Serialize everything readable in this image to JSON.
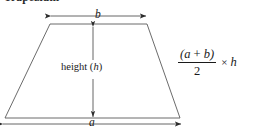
{
  "page": {
    "width": 265,
    "height": 137,
    "background": "#ffffff",
    "ink": "#1a1a1a"
  },
  "heading": {
    "text": "Trapezium",
    "note": "clipped at top edge of image"
  },
  "diagram": {
    "shape_name": "trapezoid",
    "stroke_color": "#555555",
    "fill": "none",
    "vertices": {
      "top_left": [
        50,
        24
      ],
      "top_right": [
        147,
        24
      ],
      "bottom_right": [
        180,
        118
      ],
      "bottom_left": [
        5,
        118
      ]
    }
  },
  "labels": {
    "top_base": "b",
    "bottom_base": "a",
    "height_text": "height (",
    "height_var": "h",
    "height_close": ")"
  },
  "dimensions": {
    "top_arrow": {
      "y": 16,
      "x1": 50,
      "x2": 147,
      "label": "b"
    },
    "bottom_arrow": {
      "y": 124,
      "x1": 2,
      "x2": 182,
      "label": "a"
    },
    "height_arrow": {
      "x": 93,
      "y1": 26,
      "y2": 118,
      "label": "height (h)"
    }
  },
  "formula": {
    "numerator_open": "(",
    "numerator_a": "a",
    "numerator_op": " + ",
    "numerator_b": "b",
    "numerator_close": ")",
    "denominator": "2",
    "multiply": "×",
    "factor": "h",
    "plain": "(a + b) / 2 × h"
  }
}
